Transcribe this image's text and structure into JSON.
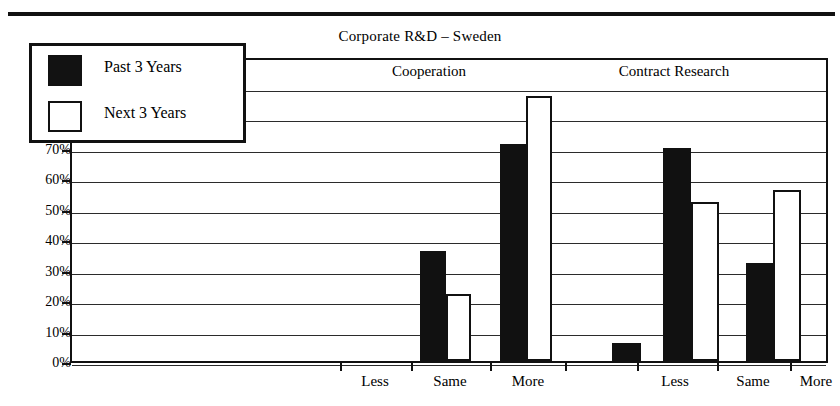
{
  "figure": {
    "title": "Corporate R&D – Sweden",
    "top_rule": "horizontal-rule"
  },
  "legend": {
    "entries": [
      {
        "label": "Past 3 Years",
        "swatch": "filled-black-square",
        "color": "#111111"
      },
      {
        "label": "Next 3 Years",
        "swatch": "hollow-white-square",
        "color": "#ffffff"
      }
    ]
  },
  "groups": [
    {
      "label": "Trends in R&D (n=21)"
    },
    {
      "label": "Cooperation"
    },
    {
      "label": "Contract Research"
    }
  ],
  "axes": {
    "y_ticks": [
      "100%",
      "90%",
      "80%",
      "70%",
      "60%",
      "50%",
      "40%",
      "30%",
      "20%",
      "10%",
      "0%"
    ],
    "x_ticks": [
      "Less",
      "Same",
      "More",
      "Less",
      "Same",
      "More"
    ]
  },
  "chart_data": {
    "type": "bar",
    "title": "Corporate R&D – Sweden",
    "xlabel": "",
    "ylabel": "",
    "ylim": [
      0,
      100
    ],
    "y_unit": "percent",
    "grid": true,
    "legend_position": "inside-upper-left",
    "group_headers": [
      "Trends in R&D (n=21)",
      "Cooperation",
      "Contract Research"
    ],
    "categories": [
      "Cooperation – Less",
      "Cooperation – Same",
      "Cooperation – More",
      "Contract Research – Less",
      "Contract Research – Same",
      "Contract Research – More"
    ],
    "series": [
      {
        "name": "Past 3 Years",
        "color": "#111111",
        "values": [
          0,
          36,
          71,
          6,
          70,
          32
        ]
      },
      {
        "name": "Next 3 Years",
        "color": "#ffffff",
        "values": [
          0,
          22,
          87,
          0,
          52,
          56
        ]
      }
    ],
    "bars": [
      {
        "group": "Cooperation",
        "category": "Less",
        "series": "Past 3 Years",
        "value": 0
      },
      {
        "group": "Cooperation",
        "category": "Less",
        "series": "Next 3 Years",
        "value": 0
      },
      {
        "group": "Cooperation",
        "category": "Same",
        "series": "Past 3 Years",
        "value": 36
      },
      {
        "group": "Cooperation",
        "category": "Same",
        "series": "Next 3 Years",
        "value": 22
      },
      {
        "group": "Cooperation",
        "category": "More",
        "series": "Past 3 Years",
        "value": 71
      },
      {
        "group": "Cooperation",
        "category": "More",
        "series": "Next 3 Years",
        "value": 87
      },
      {
        "group": "Contract Research",
        "category": "Less",
        "series": "Past 3 Years",
        "value": 6
      },
      {
        "group": "Contract Research",
        "category": "Less",
        "series": "Next 3 Years",
        "value": 0
      },
      {
        "group": "Contract Research",
        "category": "Same",
        "series": "Past 3 Years",
        "value": 70
      },
      {
        "group": "Contract Research",
        "category": "Same",
        "series": "Next 3 Years",
        "value": 52
      },
      {
        "group": "Contract Research",
        "category": "More",
        "series": "Past 3 Years",
        "value": 32
      },
      {
        "group": "Contract Research",
        "category": "More",
        "series": "Next 3 Years",
        "value": 56
      }
    ]
  },
  "layout": {
    "bar_px": [
      {
        "left": 418,
        "width": 26,
        "cls": "past",
        "value": 36
      },
      {
        "left": 444,
        "width": 25,
        "cls": "next",
        "value": 22
      },
      {
        "left": 498,
        "width": 26,
        "cls": "past",
        "value": 71
      },
      {
        "left": 524,
        "width": 26,
        "cls": "next",
        "value": 87
      },
      {
        "left": 610,
        "width": 29,
        "cls": "past",
        "value": 6
      },
      {
        "left": 661,
        "width": 28,
        "cls": "past",
        "value": 70
      },
      {
        "left": 689,
        "width": 28,
        "cls": "next",
        "value": 52
      },
      {
        "left": 744,
        "width": 27,
        "cls": "past",
        "value": 32
      },
      {
        "left": 771,
        "width": 28,
        "cls": "next",
        "value": 56
      }
    ],
    "xticks_px": [
      340,
      411,
      490,
      565,
      637,
      717,
      790
    ],
    "xlabels_px": [
      {
        "center": 375,
        "label": "Less"
      },
      {
        "center": 450,
        "label": "Same"
      },
      {
        "center": 528,
        "label": "More"
      },
      {
        "center": 675,
        "label": "Less"
      },
      {
        "center": 753,
        "label": "Same"
      },
      {
        "center": 816,
        "label": "More"
      }
    ],
    "group_label_px": [
      {
        "center": 160,
        "idx": 0
      },
      {
        "center": 427,
        "idx": 1
      },
      {
        "center": 672,
        "idx": 2
      }
    ]
  }
}
